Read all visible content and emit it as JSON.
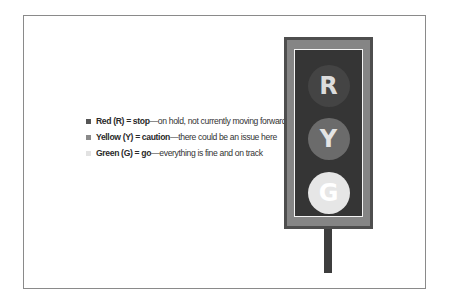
{
  "legend": {
    "items": [
      {
        "bold": "Red (R) = stop",
        "rest": "—on hold, not currently moving forward.",
        "swatch": "#555555"
      },
      {
        "bold": "Yellow (Y) = caution",
        "rest": "—there could be an issue here",
        "swatch": "#8a8a8a"
      },
      {
        "bold": "Green (G) = go",
        "rest": "—everything is fine and on track",
        "swatch": "#e2e2e2"
      }
    ]
  },
  "traffic_light": {
    "lamps": [
      {
        "letter": "R",
        "fill": "#444444",
        "text_color": "#dcdcdc",
        "top": 15
      },
      {
        "letter": "Y",
        "fill": "#6b6b6b",
        "text_color": "#e4e4e4",
        "top": 68
      },
      {
        "letter": "G",
        "fill": "#e6e6e6",
        "text_color": "#ffffff",
        "top": 122
      }
    ]
  }
}
